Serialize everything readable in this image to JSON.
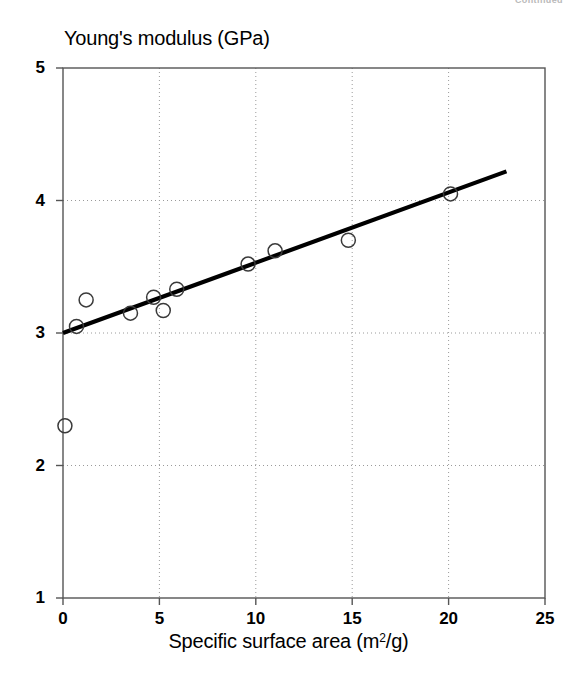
{
  "page": {
    "running_head": "Continued"
  },
  "chart_data": {
    "type": "scatter",
    "title": "",
    "ylabel": "Young's modulus (GPa)",
    "xlabel": "Specific surface area (m²/g)",
    "xlabel_base": "Specific surface area (m",
    "xlabel_sup": "2",
    "xlabel_tail": "/g)",
    "xlim": [
      0,
      25
    ],
    "ylim": [
      1,
      5
    ],
    "grid": true,
    "grid_style": "dotted",
    "legend": "none",
    "marker": "open-circle",
    "xticks": [
      "0",
      "5",
      "10",
      "15",
      "20",
      "25"
    ],
    "xtick_values": [
      0,
      5,
      10,
      15,
      20,
      25
    ],
    "yticks": [
      "1",
      "2",
      "3",
      "4",
      "5"
    ],
    "ytick_values": [
      1,
      2,
      3,
      4,
      5
    ],
    "series": [
      {
        "name": "measurements",
        "marker": "open-circle",
        "points": [
          {
            "x": 0.1,
            "y": 2.3
          },
          {
            "x": 0.7,
            "y": 3.05
          },
          {
            "x": 1.2,
            "y": 3.25
          },
          {
            "x": 3.5,
            "y": 3.15
          },
          {
            "x": 4.7,
            "y": 3.27
          },
          {
            "x": 5.2,
            "y": 3.17
          },
          {
            "x": 5.9,
            "y": 3.33
          },
          {
            "x": 9.6,
            "y": 3.52
          },
          {
            "x": 11.0,
            "y": 3.62
          },
          {
            "x": 14.8,
            "y": 3.7
          },
          {
            "x": 20.1,
            "y": 4.05
          }
        ]
      },
      {
        "name": "regression-line",
        "type": "line",
        "endpoints": [
          {
            "x": 0.0,
            "y": 3.0
          },
          {
            "x": 23.0,
            "y": 4.22
          }
        ]
      }
    ]
  }
}
